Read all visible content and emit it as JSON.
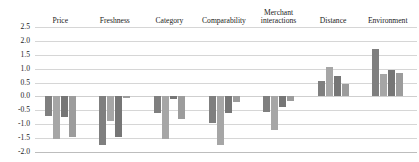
{
  "chart_data": {
    "type": "bar",
    "title": "",
    "xlabel": "",
    "ylabel": "",
    "ylim": [
      -2.0,
      2.5
    ],
    "ytick_step": 0.5,
    "yticks": [
      "2.5",
      "2.0",
      "1.5",
      "1.0",
      "0.5",
      "0.0",
      "-0.5",
      "-1.0",
      "-1.5",
      "-2.0"
    ],
    "grid": true,
    "legend_position": "none",
    "category_labels_position": "top",
    "categories": [
      "Price",
      "Freshness",
      "Category",
      "Comparability",
      "Merchant interactions",
      "Distance",
      "Environment"
    ],
    "series": [
      {
        "name": "series-1",
        "color": "#7f7f7f",
        "values": [
          -0.7,
          -1.75,
          -0.6,
          -0.95,
          -0.55,
          0.55,
          1.7
        ]
      },
      {
        "name": "series-2",
        "color": "#a6a6a6",
        "values": [
          -1.55,
          -0.9,
          -1.55,
          -1.75,
          -1.2,
          1.05,
          0.8
        ]
      },
      {
        "name": "series-3",
        "color": "#767676",
        "values": [
          -0.75,
          -1.45,
          -0.1,
          -0.6,
          -0.4,
          0.75,
          0.95
        ]
      },
      {
        "name": "series-4",
        "color": "#9c9c9c",
        "values": [
          -1.45,
          -0.05,
          -0.8,
          -0.2,
          -0.15,
          0.45,
          0.85
        ]
      }
    ]
  }
}
